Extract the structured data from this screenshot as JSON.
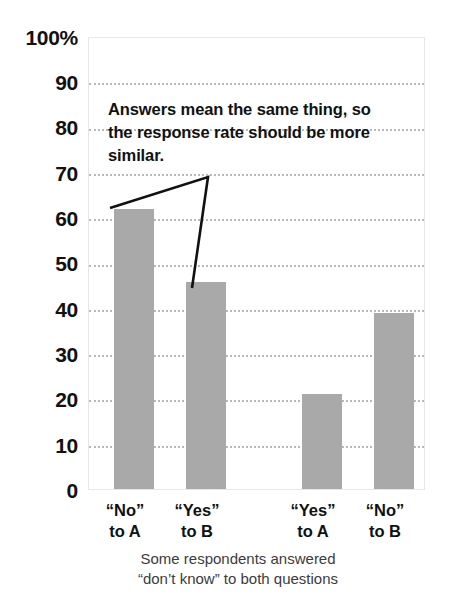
{
  "chart_data": {
    "type": "bar",
    "title": "",
    "subtitle": "",
    "xlabel": "",
    "ylabel": "",
    "ylim": [
      0,
      100
    ],
    "y_unit": "%",
    "grid": true,
    "legend": "none",
    "categories": [
      "“No” to A",
      "“Yes” to B",
      "“Yes” to A",
      "“No” to B"
    ],
    "category_lines": [
      {
        "line1": "“No”",
        "line2": "to A"
      },
      {
        "line1": "“Yes”",
        "line2": "to B"
      },
      {
        "line1": "“Yes”",
        "line2": "to A"
      },
      {
        "line1": "“No”",
        "line2": "to B"
      }
    ],
    "values": [
      62,
      46,
      21,
      39
    ],
    "bar_color": "#a9a9a9",
    "gridline_color": "#b9b9b9",
    "y_ticks": [
      {
        "value": 100,
        "label": "100%"
      },
      {
        "value": 90,
        "label": "90"
      },
      {
        "value": 80,
        "label": "80"
      },
      {
        "value": 70,
        "label": "70"
      },
      {
        "value": 60,
        "label": "60"
      },
      {
        "value": 50,
        "label": "50"
      },
      {
        "value": 40,
        "label": "40"
      },
      {
        "value": 30,
        "label": "30"
      },
      {
        "value": 20,
        "label": "20"
      },
      {
        "value": 10,
        "label": "10"
      },
      {
        "value": 0,
        "label": "0"
      }
    ],
    "annotations": [
      {
        "id": "callout",
        "text": "Answers mean the same thing, so the response rate should be more similar.",
        "lines": [
          "Answers mean the same",
          "thing, so the response rate",
          "should be more similar."
        ],
        "points_to": [
          "“No” to A",
          "“Yes” to B"
        ],
        "marker": "v-pointer"
      }
    ],
    "footnote_lines": [
      "Some respondents answered",
      "“don’t know” to both questions"
    ]
  }
}
